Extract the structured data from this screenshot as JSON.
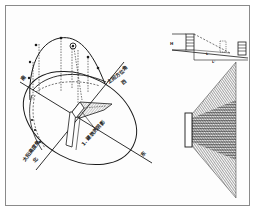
{
  "figure": {
    "left_diagram": {
      "title": "sun-path-diagram",
      "labels": {
        "south": "南",
        "west": "西",
        "north": "北",
        "east": "东",
        "azimuth": "太阳方位角",
        "altitude": "太阳高度角",
        "shadow": "1. 建筑的阴影"
      }
    },
    "right_top_diagram": {
      "title": "building-shadow-section",
      "labels": {
        "h": "H",
        "l1": "L",
        "l2": "L'"
      }
    },
    "right_bottom_diagram": {
      "title": "shadow-fan-plan"
    }
  },
  "colors": {
    "ink": "#1a1a1a",
    "frame": "#8a8a8a",
    "hatch": "#3a3a3a",
    "paper": "#fdfdfd"
  }
}
